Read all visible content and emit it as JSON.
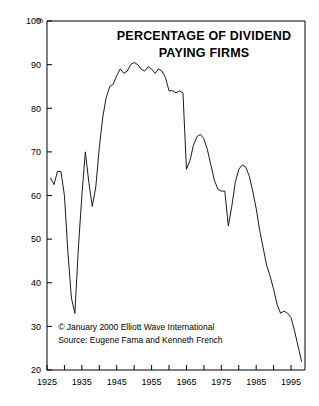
{
  "chart_data": {
    "type": "line",
    "title": "PERCENTAGE OF DIVIDEND PAYING FIRMS",
    "title_lines": [
      "PERCENTAGE OF DIVIDEND",
      "PAYING FIRMS"
    ],
    "xlabel": "",
    "ylabel": "",
    "y_unit": "%",
    "xlim": [
      1925,
      1999
    ],
    "ylim": [
      20,
      100
    ],
    "grid": false,
    "legend": "none",
    "y_ticks": [
      100,
      90,
      80,
      70,
      60,
      50,
      40,
      30,
      20
    ],
    "y_tick_labels": [
      "100",
      "90",
      "80",
      "70",
      "60",
      "50",
      "40",
      "30",
      "20"
    ],
    "x_ticks_major": [
      1925,
      1935,
      1945,
      1955,
      1965,
      1975,
      1985,
      1995
    ],
    "x_tick_labels": [
      "1925",
      "1935",
      "1945",
      "1955",
      "1965",
      "1975",
      "1985",
      "1995"
    ],
    "x_ticks_minor": [
      1930,
      1940,
      1950,
      1960,
      1970,
      1980,
      1990
    ],
    "series": [
      {
        "name": "Percentage of dividend paying firms",
        "color": "#1a1a1a",
        "x": [
          1926,
          1927,
          1928,
          1929,
          1930,
          1931,
          1932,
          1933,
          1934,
          1935,
          1936,
          1937,
          1938,
          1939,
          1940,
          1941,
          1942,
          1943,
          1944,
          1945,
          1946,
          1947,
          1948,
          1949,
          1950,
          1951,
          1952,
          1953,
          1954,
          1955,
          1956,
          1957,
          1958,
          1959,
          1960,
          1961,
          1962,
          1963,
          1964,
          1965,
          1966,
          1967,
          1968,
          1969,
          1970,
          1971,
          1972,
          1973,
          1974,
          1975,
          1976,
          1977,
          1978,
          1979,
          1980,
          1981,
          1982,
          1983,
          1984,
          1985,
          1986,
          1987,
          1988,
          1989,
          1990,
          1991,
          1992,
          1993,
          1994,
          1995,
          1996,
          1997,
          1998
        ],
        "y": [
          64.0,
          62.5,
          65.5,
          65.5,
          60.0,
          47.0,
          36.5,
          33.0,
          48.0,
          60.0,
          70.0,
          63.0,
          57.5,
          62.0,
          71.0,
          78.0,
          82.5,
          85.0,
          85.5,
          87.5,
          89.0,
          88.0,
          88.5,
          90.0,
          90.5,
          90.0,
          89.0,
          88.5,
          89.5,
          89.0,
          88.0,
          89.0,
          88.5,
          87.0,
          84.0,
          84.0,
          83.5,
          84.0,
          83.5,
          66.0,
          68.0,
          71.5,
          73.5,
          74.0,
          73.0,
          70.5,
          67.0,
          63.5,
          61.5,
          61.0,
          61.0,
          53.0,
          57.5,
          63.0,
          66.0,
          67.0,
          66.5,
          64.5,
          61.0,
          57.0,
          52.0,
          48.0,
          44.0,
          41.5,
          38.5,
          35.0,
          33.0,
          33.5,
          33.0,
          32.0,
          29.0,
          25.5,
          22.0
        ]
      }
    ],
    "annotations": [
      {
        "id": "copyright",
        "text": "© January 2000 Elliott Wave International",
        "x_year": 1928.2,
        "y_value": 29.2
      },
      {
        "id": "source",
        "text": "Source: Eugene Fama and Kenneth French",
        "x_year": 1928.2,
        "y_value": 26.2
      }
    ]
  },
  "colors": {
    "background": "#ffffff",
    "axis": "#000000",
    "line": "#1a1a1a",
    "text": "#000000"
  }
}
